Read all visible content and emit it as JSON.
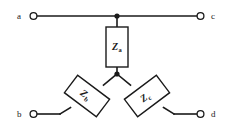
{
  "diagram": {
    "background_color": "#ffffff",
    "line_color": "#1a1a1a",
    "terminals": [
      {
        "id": "a",
        "label": "a",
        "x": 30,
        "y": 16,
        "label_x": 17,
        "label_y": 19
      },
      {
        "id": "c",
        "label": "c",
        "x": 204,
        "y": 16,
        "label_x": 213,
        "label_y": 19
      },
      {
        "id": "b",
        "label": "b",
        "x": 30,
        "y": 114,
        "label_x": 17,
        "label_y": 117
      },
      {
        "id": "d",
        "label": "d",
        "x": 204,
        "y": 114,
        "label_x": 213,
        "label_y": 117
      }
    ],
    "junctions": [
      {
        "id": "top-node",
        "x": 117,
        "y": 16
      },
      {
        "id": "center-node",
        "x": 117,
        "y": 74
      }
    ],
    "components": [
      {
        "id": "Za",
        "label": "Z",
        "subscript": "a",
        "orientation": "vertical",
        "rotation": 0,
        "cx": 117,
        "cy": 47,
        "width": 22,
        "height": 40
      },
      {
        "id": "Zb",
        "label": "Z",
        "subscript": "b",
        "orientation": "diagonal-left",
        "rotation": 37,
        "cx": 87,
        "cy": 96,
        "width": 40,
        "height": 22
      },
      {
        "id": "Zc",
        "label": "Z",
        "subscript": "c",
        "orientation": "diagonal-right",
        "rotation": -37,
        "cx": 147,
        "cy": 96,
        "width": 40,
        "height": 22
      }
    ],
    "wires": [
      {
        "id": "wire-a-to-top-node",
        "d": "M 37 16 L 117 16"
      },
      {
        "id": "wire-top-node-to-c",
        "d": "M 117 16 L 197 16"
      },
      {
        "id": "wire-top-node-to-za",
        "d": "M 117 16 L 117 27"
      },
      {
        "id": "wire-za-to-center",
        "d": "M 117 67 L 117 74"
      },
      {
        "id": "wire-center-to-zb",
        "d": "M 117 74 L 104 85"
      },
      {
        "id": "wire-zb-to-bend",
        "d": "M 70 108 L 60 114"
      },
      {
        "id": "wire-bend-to-b",
        "d": "M 60 114 L 37 114"
      },
      {
        "id": "wire-center-to-zc",
        "d": "M 117 74 L 130 85"
      },
      {
        "id": "wire-zc-to-bend",
        "d": "M 164 108 L 174 114"
      },
      {
        "id": "wire-bend-to-d",
        "d": "M 174 114 L 197 114"
      }
    ]
  }
}
